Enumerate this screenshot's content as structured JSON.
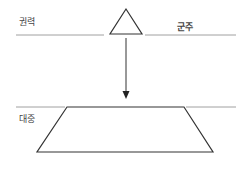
{
  "diagram": {
    "labels": {
      "power": "권력",
      "monarch": "군주",
      "masses": "대중"
    },
    "colors": {
      "line": "#999999",
      "shape": "#333333"
    }
  }
}
